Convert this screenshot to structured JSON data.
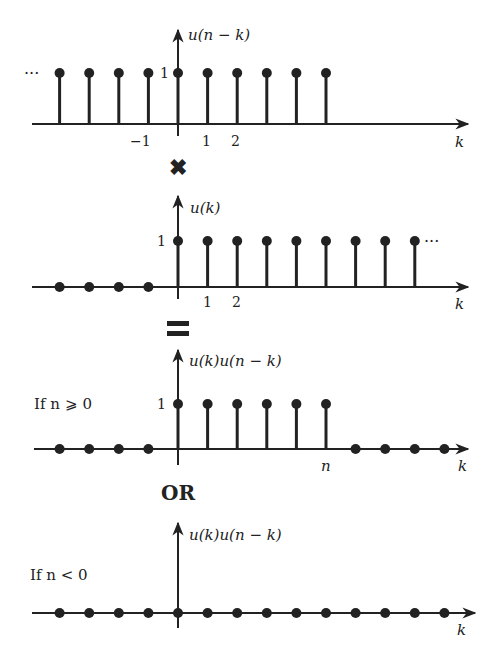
{
  "diagram": {
    "colors": {
      "ink": "#222222",
      "background": "#ffffff"
    },
    "panels": [
      {
        "id": "shifted-step",
        "ylabel": "u(n − k)",
        "xlabel": "k",
        "amplitude_label": "1",
        "tick_labels": [
          {
            "text": "−1",
            "k": -1
          },
          {
            "text": "1",
            "k": 1
          },
          {
            "text": "2",
            "k": 2
          }
        ],
        "ellipsis": "···",
        "ellipsis_side": "left",
        "stems_k": [
          -4,
          -3,
          -2,
          -1,
          0,
          1,
          2,
          3,
          4,
          5
        ],
        "dots_k": []
      },
      {
        "id": "unit-step",
        "ylabel": "u(k)",
        "xlabel": "k",
        "amplitude_label": "1",
        "tick_labels": [
          {
            "text": "1",
            "k": 1
          },
          {
            "text": "2",
            "k": 2
          }
        ],
        "ellipsis": "···",
        "ellipsis_side": "right",
        "stems_k": [
          0,
          1,
          2,
          3,
          4,
          5,
          6,
          7,
          8
        ],
        "dots_k": [
          -4,
          -3,
          -2,
          -1
        ]
      },
      {
        "id": "product-n-nonneg",
        "condition": "If n ⩾ 0",
        "ylabel": "u(k)u(n − k)",
        "xlabel": "k",
        "amplitude_label": "1",
        "tick_labels": [
          {
            "text": "n",
            "k": 5
          }
        ],
        "stems_k": [
          0,
          1,
          2,
          3,
          4,
          5
        ],
        "dots_k": [
          -4,
          -3,
          -2,
          -1,
          6,
          7,
          8,
          9
        ]
      },
      {
        "id": "product-n-neg",
        "condition": "If n < 0",
        "ylabel": "u(k)u(n − k)",
        "xlabel": "k",
        "tick_labels": [],
        "stems_k": [],
        "dots_k": [
          -4,
          -3,
          -2,
          -1,
          0,
          1,
          2,
          3,
          4,
          5,
          6,
          7,
          8,
          9
        ]
      }
    ],
    "operators": {
      "multiply": "✖",
      "equals": "=",
      "or": "OR"
    }
  }
}
